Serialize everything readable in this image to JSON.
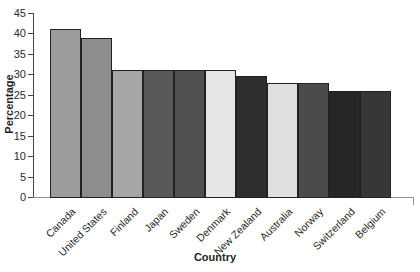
{
  "chart_data": {
    "type": "bar",
    "title": "",
    "xlabel": "Country",
    "ylabel": "Percentage",
    "categories": [
      "Canada",
      "United States",
      "Finland",
      "Japan",
      "Sweden",
      "Denmark",
      "New Zealand",
      "Australia",
      "Norway",
      "Switzerland",
      "Belgium"
    ],
    "values": [
      41,
      39,
      31,
      31,
      31,
      31,
      29.5,
      28,
      28,
      26,
      26
    ],
    "bar_colors": [
      "#9c9c9c",
      "#8d8d8d",
      "#a6a6a6",
      "#595959",
      "#505050",
      "#e6e6e6",
      "#2e2e2e",
      "#dfdfdf",
      "#4b4b4b",
      "#262626",
      "#373737"
    ],
    "bar_outline_color": "#222222",
    "ylim": [
      0,
      45
    ],
    "yticks": [
      0,
      5,
      10,
      15,
      20,
      25,
      30,
      35,
      40,
      45
    ],
    "grid": false,
    "legend": "none",
    "axis_color": "#444444",
    "text_color": "#2b2b2b",
    "background_color": "#ffffff"
  }
}
